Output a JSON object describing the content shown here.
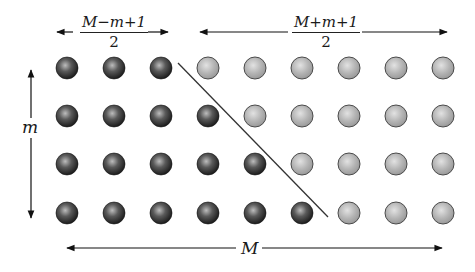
{
  "diagram": {
    "grid": {
      "rows": 4,
      "columns": 9,
      "column_centers_x": [
        67,
        114,
        161,
        208,
        255,
        302,
        349,
        396,
        443
      ],
      "row_centers_y": [
        68,
        116,
        164,
        213
      ],
      "ball_radius": 11,
      "dark_count_per_row": [
        3,
        4,
        5,
        6
      ],
      "dark_color": "#1c1c1c",
      "dark_highlight": "#bdbdbd",
      "light_color": "#9a9a9a",
      "light_highlight": "#e2e2e2",
      "outline_color": "#4a4a4a"
    },
    "divider_line": {
      "x1": 178,
      "y1": 63,
      "x2": 328,
      "y2": 217,
      "color": "#333333"
    },
    "labels": {
      "top_left_fraction": {
        "numerator": "M−m+1",
        "denominator": "2"
      },
      "top_right_fraction": {
        "numerator": "M+m+1",
        "denominator": "2"
      },
      "left_vertical": "m",
      "bottom_horizontal": "M"
    },
    "arrows": {
      "top_left": {
        "y": 32,
        "left_from": 73,
        "left_to": 57,
        "right_from": 148,
        "right_to": 168
      },
      "top_right": {
        "y": 32,
        "left_from": 288,
        "left_to": 200,
        "right_from": 362,
        "right_to": 447
      },
      "left": {
        "x": 31,
        "up_from": 118,
        "up_to": 70,
        "down_from": 138,
        "down_to": 218
      },
      "bottom": {
        "y": 248,
        "left_from": 236,
        "left_to": 67,
        "right_from": 262,
        "right_to": 442
      }
    }
  }
}
